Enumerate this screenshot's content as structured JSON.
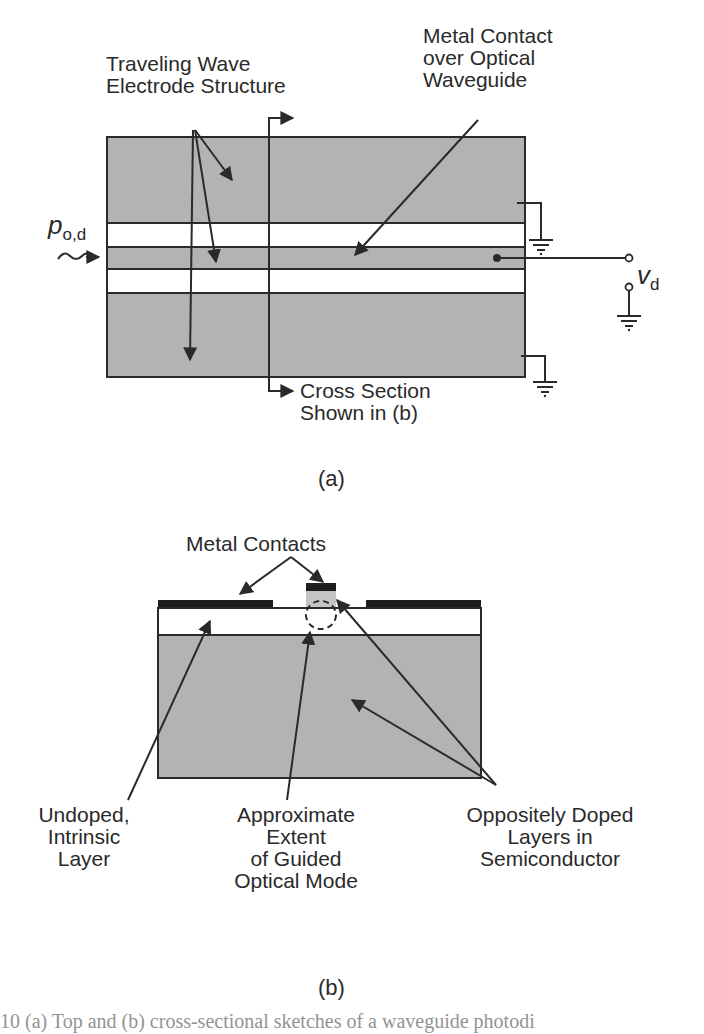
{
  "figure_a": {
    "labels": {
      "traveling_wave_line1": "Traveling Wave",
      "traveling_wave_line2": "Electrode Structure",
      "metal_contact_line1": "Metal Contact",
      "metal_contact_line2": "over Optical",
      "metal_contact_line3": "Waveguide",
      "cross_section_line1": "Cross Section",
      "cross_section_line2": "Shown in (b)",
      "input_power_symbol": "p",
      "input_power_subscript": "o,d",
      "voltage_symbol": "v",
      "voltage_subscript": "d"
    },
    "caption": "(a)",
    "colors": {
      "electrode_fill": "#b3b3b3",
      "gap_fill": "#ffffff",
      "line": "#2a2a2a"
    }
  },
  "figure_b": {
    "labels": {
      "metal_contacts": "Metal Contacts",
      "undoped_line1": "Undoped,",
      "undoped_line2": "Intrinsic",
      "undoped_line3": "Layer",
      "approx_line1": "Approximate",
      "approx_line2": "Extent",
      "approx_line3": "of Guided",
      "approx_line4": "Optical Mode",
      "oppositely_line1": "Oppositely Doped",
      "oppositely_line2": "Layers in",
      "oppositely_line3": "Semiconductor"
    },
    "caption": "(b)",
    "colors": {
      "semiconductor_fill": "#b3b3b3",
      "metal_fill": "#1e1e1e",
      "intrinsic_fill": "#ffffff",
      "ridge_fill": "#c4c4c4"
    }
  },
  "figure_caption_partial": "10 (a) Top and (b) cross-sectional sketches of a waveguide photodi"
}
